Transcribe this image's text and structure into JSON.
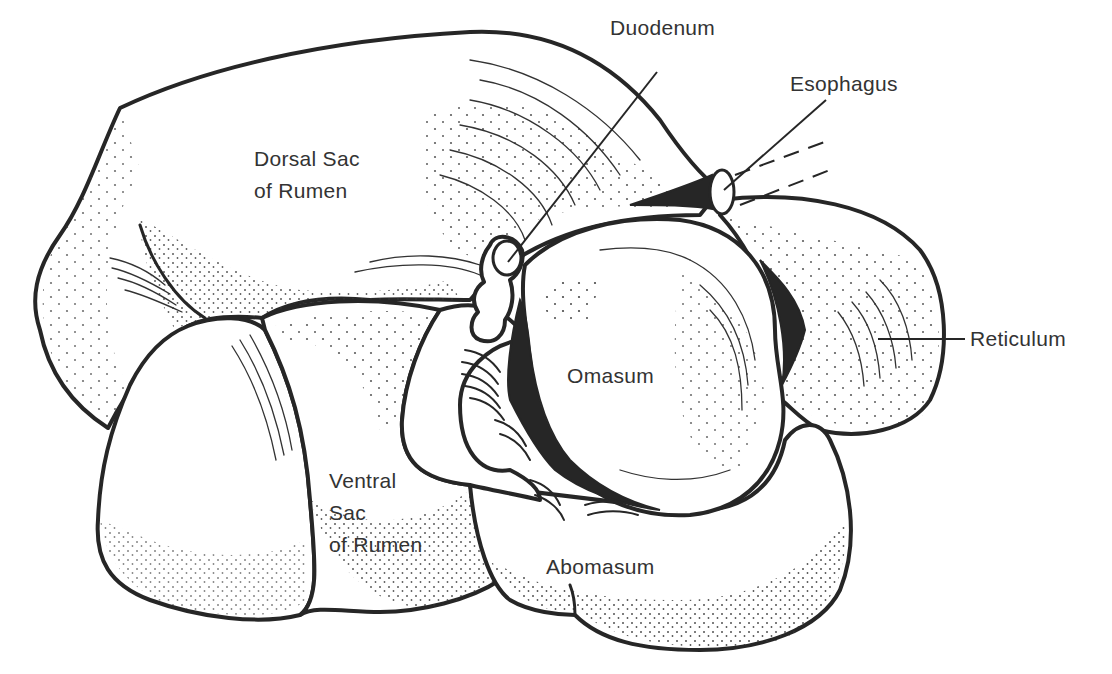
{
  "figure": {
    "colors": {
      "ink": "#262626",
      "text": "#333333",
      "background": "#ffffff"
    },
    "labels": {
      "duodenum": "Duodenum",
      "esophagus": "Esophagus",
      "dorsal_sac_line1": "Dorsal Sac",
      "dorsal_sac_line2": "of Rumen",
      "reticulum": "Reticulum",
      "omasum": "Omasum",
      "ventral_sac_line1": "Ventral",
      "ventral_sac_line2": "Sac",
      "ventral_sac_line3": "of Rumen",
      "abomasum": "Abomasum"
    }
  }
}
